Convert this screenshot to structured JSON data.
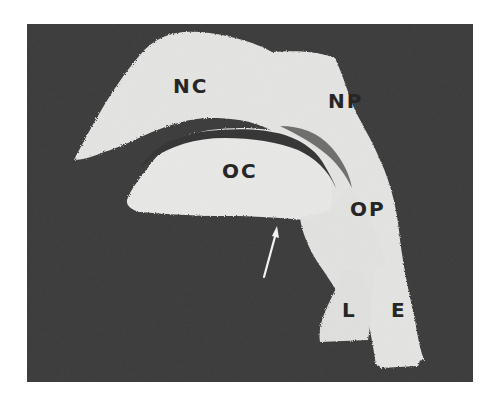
{
  "figure": {
    "background_color": "#3a3a3a",
    "cast_color": "#e6e6e4",
    "labels": {
      "nc": "NC",
      "np": "NP",
      "oc": "OC",
      "op": "OP",
      "l": "L",
      "e": "E"
    },
    "arrow": "white arrow pointing up toward oral cavity floor"
  }
}
